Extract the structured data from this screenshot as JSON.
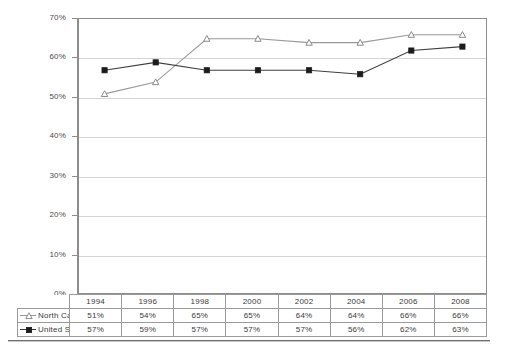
{
  "chart_data": {
    "type": "line",
    "title": "",
    "subtitle": "",
    "xlabel": "",
    "ylabel": "",
    "categories": [
      "1994",
      "1996",
      "1998",
      "2000",
      "2002",
      "2004",
      "2006",
      "2008"
    ],
    "series": [
      {
        "name": "North Carolina",
        "values": [
          51,
          54,
          65,
          65,
          64,
          64,
          66,
          66
        ],
        "labels": [
          "51%",
          "54%",
          "65%",
          "65%",
          "64%",
          "64%",
          "66%",
          "66%"
        ],
        "marker": "open-triangle",
        "line_color": "#999999",
        "marker_color": "#ffffff",
        "marker_edge_color": "#8a8a8a"
      },
      {
        "name": "United States",
        "values": [
          57,
          59,
          57,
          57,
          57,
          56,
          62,
          63
        ],
        "labels": [
          "57%",
          "59%",
          "57%",
          "57%",
          "57%",
          "56%",
          "62%",
          "63%"
        ],
        "marker": "filled-square",
        "line_color": "#3f3f3f",
        "marker_color": "#1c1c1c",
        "marker_edge_color": "#1c1c1c"
      }
    ],
    "ylim": [
      0,
      70
    ],
    "ytick_values": [
      0,
      10,
      20,
      30,
      40,
      50,
      60,
      70
    ],
    "ytick_labels": [
      "0%",
      "10%",
      "20%",
      "30%",
      "40%",
      "50%",
      "60%",
      "70%"
    ],
    "grid": true,
    "grid_axis": "y",
    "grid_color": "#d4d4d4",
    "legend_position": "data-table-left-column",
    "data_table_visible": true,
    "axis_color": "#8c8c8c",
    "background_color": "#ffffff"
  },
  "table": {
    "header_row_label": "",
    "columns": [
      "1994",
      "1996",
      "1998",
      "2000",
      "2002",
      "2004",
      "2006",
      "2008"
    ],
    "rows": [
      {
        "label": "North Carolina",
        "marker": "open-triangle-marker-icon",
        "cells": [
          "51%",
          "54%",
          "65%",
          "65%",
          "64%",
          "64%",
          "66%",
          "66%"
        ]
      },
      {
        "label": "United States",
        "marker": "filled-square-marker-icon",
        "cells": [
          "57%",
          "59%",
          "57%",
          "57%",
          "57%",
          "56%",
          "62%",
          "63%"
        ]
      }
    ]
  }
}
